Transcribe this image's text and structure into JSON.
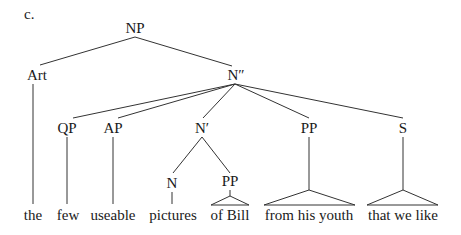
{
  "figure": {
    "label": "c.",
    "nodes": {
      "np": "NP",
      "art": "Art",
      "n_double_bar": "N″",
      "qp": "QP",
      "ap": "AP",
      "n_bar": "N′",
      "pp_youth": "PP",
      "s": "S",
      "n": "N",
      "pp_bill": "PP"
    },
    "leaves": {
      "the": "the",
      "few": "few",
      "useable": "useable",
      "pictures": "pictures",
      "of_bill": "of Bill",
      "from_his_youth": "from his youth",
      "that_we_like": "that we like"
    }
  }
}
